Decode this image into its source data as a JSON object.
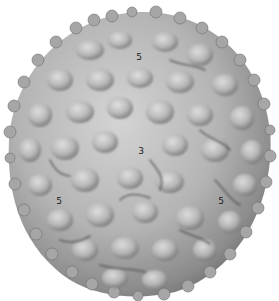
{
  "figure": {
    "colors": {
      "background": "#ffffff",
      "surface_light": "#d6d6d6",
      "surface_mid": "#a8a8a8",
      "surface_dark": "#5a5a5a"
    },
    "symmetry_labels": [
      {
        "text": "5",
        "x": 139,
        "y": 57
      },
      {
        "text": "3",
        "x": 141,
        "y": 151
      },
      {
        "text": "5",
        "x": 59,
        "y": 201
      },
      {
        "text": "5",
        "x": 221,
        "y": 201
      }
    ]
  }
}
